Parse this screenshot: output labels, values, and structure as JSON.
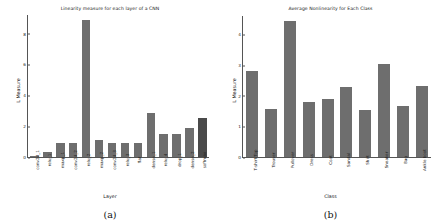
{
  "figure": {
    "caption_a": "(a)",
    "caption_b": "(b)",
    "bar_color": "#6e6e6e",
    "accent_bar_color": "#4a4a4a"
  },
  "chart_data": [
    {
      "type": "bar",
      "panel": "a",
      "title": "Linearity measure for each layer of a CNN",
      "xlabel": "Layer",
      "ylabel": "L Measure",
      "ylim": [
        0,
        9.2
      ],
      "yticks": [
        0,
        2,
        4,
        6,
        8
      ],
      "grid": false,
      "legend": "none",
      "categories": [
        "conv2d_1",
        "relu_1",
        "maxp_1",
        "conv2d_2",
        "relu_2",
        "maxp_2",
        "conv2d_3",
        "relu_3",
        "flat",
        "dense_1",
        "relu_4",
        "drop_1",
        "dense_2",
        "softmax"
      ],
      "values": [
        0.02,
        0.35,
        0.88,
        0.88,
        8.9,
        1.1,
        0.93,
        0.93,
        0.93,
        2.85,
        1.5,
        1.5,
        1.85,
        2.5
      ],
      "highlighted_index": 13
    },
    {
      "type": "bar",
      "panel": "b",
      "title": "Average Nonlinearity for Each Class",
      "xlabel": "Class",
      "ylabel": "L Measure",
      "ylim": [
        0,
        4.6
      ],
      "yticks": [
        0,
        1,
        2,
        3,
        4
      ],
      "grid": false,
      "legend": "none",
      "categories": [
        "T-shirt/Top",
        "Trouser",
        "Pullover",
        "Dress",
        "Coat",
        "Sandal",
        "Shirt",
        "Sneaker",
        "Bag",
        "Ankle boot"
      ],
      "values": [
        2.82,
        1.58,
        4.45,
        1.8,
        1.9,
        2.3,
        1.52,
        3.05,
        1.68,
        2.32
      ]
    }
  ]
}
